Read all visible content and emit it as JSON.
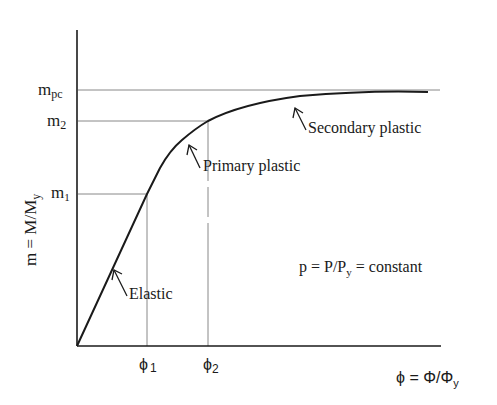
{
  "diagram": {
    "type": "moment-curvature",
    "y_axis": {
      "label_main": "m = M/M",
      "label_sub": "y",
      "ticks": [
        {
          "main": "m",
          "sub": "pc",
          "value_y": 90
        },
        {
          "main": "m",
          "sub": "2",
          "value_y": 121
        },
        {
          "main": "m",
          "sub": "1",
          "value_y": 194
        }
      ]
    },
    "x_axis": {
      "label_main": "ϕ = Φ/Φ",
      "label_sub": "y",
      "ticks": [
        {
          "main": "ϕ",
          "sub": "1",
          "value_x": 147
        },
        {
          "main": "ϕ",
          "sub": "2",
          "value_x": 208
        }
      ]
    },
    "annotations": {
      "elastic": "Elastic",
      "primary_plastic": "Primary plastic",
      "secondary_plastic": "Secondary plastic",
      "condition_main": "p = P/P",
      "condition_sub": "y",
      "condition_tail": " = constant"
    },
    "colors": {
      "axis": "#1a1a1a",
      "curve": "#1a1a1a",
      "guide": "#777777"
    }
  }
}
